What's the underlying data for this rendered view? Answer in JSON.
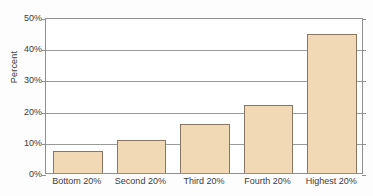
{
  "chart_data": {
    "type": "bar",
    "title": "",
    "subtitle": "",
    "xlabel": "",
    "ylabel": "Percent",
    "categories": [
      "Bottom 20%",
      "Second 20%",
      "Third 20%",
      "Fourth 20%",
      "Highest 20%"
    ],
    "values": [
      7.0,
      10.7,
      15.8,
      21.8,
      44.7
    ],
    "ylim": [
      0,
      50
    ],
    "y_ticks": [
      0,
      10,
      20,
      30,
      40,
      50
    ],
    "y_tick_labels": [
      "0%",
      "10%",
      "20%",
      "30%",
      "40%",
      "50%"
    ],
    "grid": true,
    "grid_axis": "y",
    "legend": false,
    "legend_position": "none",
    "colors": {
      "bar_fill": "#f2d9b5",
      "bar_border": "#8a7560",
      "gridline": "#9a9a9a",
      "axis": "#8f8f8f",
      "text": "#3b3b3b",
      "plot_background": "#ffffff",
      "figure_background": "#fdfdfd"
    }
  }
}
